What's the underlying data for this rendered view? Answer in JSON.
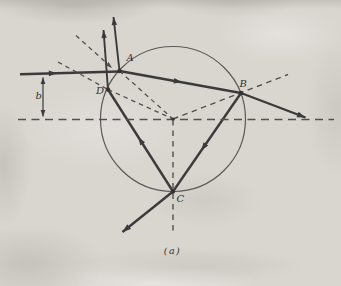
{
  "figure": {
    "caption": "(a)",
    "colors": {
      "ink": "#3b3b3b",
      "dash": "#515151",
      "circle_stroke": "#5a5a5a",
      "dot": "#333333",
      "label": "#333333",
      "paper": "#d9d6d0"
    },
    "circle": {
      "cx": 173,
      "cy": 119,
      "r": 72.5
    },
    "center_dot": {
      "x": 173,
      "y": 119,
      "r": 1.6
    },
    "points": [
      {
        "id": "A",
        "x": 119.5,
        "y": 71,
        "r": 2.2
      },
      {
        "id": "B",
        "x": 241,
        "y": 93,
        "r": 2.2
      },
      {
        "id": "C",
        "x": 173,
        "y": 191.5,
        "r": 2.2
      },
      {
        "id": "D",
        "x": 108,
        "y": 89.5,
        "r": 2.2
      }
    ],
    "segments": [
      {
        "name": "incident-ray",
        "x1": 20,
        "y1": 74.2,
        "x2": 119.5,
        "y2": 71.5,
        "w": 2.4,
        "dash": null,
        "arrows": [
          {
            "at": 0.33,
            "l": 8,
            "wd": 5.6
          }
        ]
      },
      {
        "name": "surface-reflected-ray-at-A",
        "x1": 119.5,
        "y1": 71,
        "x2": 113.5,
        "y2": 17,
        "w": 1.9,
        "dash": null,
        "arrows": [
          {
            "at": "end",
            "l": 8,
            "wd": 5.4
          }
        ]
      },
      {
        "name": "refracted-ray-A-to-B",
        "x1": 119.5,
        "y1": 71,
        "x2": 241,
        "y2": 93,
        "w": 2.4,
        "dash": null,
        "arrows": [
          {
            "at": 0.48,
            "l": 8,
            "wd": 5.6
          }
        ]
      },
      {
        "name": "internal-ray-B-to-C",
        "x1": 241,
        "y1": 93,
        "x2": 173,
        "y2": 191.5,
        "w": 2.4,
        "dash": null,
        "arrows": [
          {
            "at": 0.55,
            "l": 8,
            "wd": 5.6
          }
        ]
      },
      {
        "name": "internal-ray-C-to-D",
        "x1": 173,
        "y1": 191.5,
        "x2": 108,
        "y2": 89.5,
        "w": 2.4,
        "dash": null,
        "arrows": [
          {
            "at": 0.5,
            "l": 8,
            "wd": 5.6
          }
        ]
      },
      {
        "name": "exit-ray-at-D",
        "x1": 108,
        "y1": 89.5,
        "x2": 103.5,
        "y2": 30,
        "w": 1.9,
        "dash": null,
        "arrows": [
          {
            "at": "end",
            "l": 8,
            "wd": 5.4
          }
        ]
      },
      {
        "name": "exit-ray-at-B",
        "x1": 241,
        "y1": 93,
        "x2": 305.5,
        "y2": 117.5,
        "w": 2.4,
        "dash": null,
        "arrows": [
          {
            "at": "end",
            "l": 8.5,
            "wd": 6
          }
        ]
      },
      {
        "name": "exit-ray-at-C",
        "x1": 173,
        "y1": 191.5,
        "x2": 122.5,
        "y2": 232,
        "w": 2.4,
        "dash": null,
        "arrows": [
          {
            "at": "end",
            "l": 8.5,
            "wd": 6
          }
        ]
      },
      {
        "name": "horizontal-axis-dashed",
        "x1": 18,
        "y1": 119.5,
        "x2": 334,
        "y2": 119.5,
        "w": 1.5,
        "dash": "8 5.5",
        "arrows": []
      },
      {
        "name": "vertical-axis-dashed",
        "x1": 173,
        "y1": 120,
        "x2": 173,
        "y2": 235,
        "w": 1.4,
        "dash": "5.5 5",
        "arrows": []
      },
      {
        "name": "normal-at-A-outer-dashed",
        "x1": 76,
        "y1": 35.5,
        "x2": 112,
        "y2": 68,
        "w": 1.3,
        "dash": "4.5 4",
        "arrows": [
          {
            "at": "end",
            "l": 6.5,
            "wd": 4.6
          }
        ]
      },
      {
        "name": "normal-at-A-inner-dashed",
        "x1": 119.5,
        "y1": 71,
        "x2": 173,
        "y2": 119,
        "w": 1.3,
        "dash": "4.5 4",
        "arrows": []
      },
      {
        "name": "normal-at-D-outer-dashed",
        "x1": 58,
        "y1": 62,
        "x2": 108,
        "y2": 89.5,
        "w": 1.3,
        "dash": "4.5 4",
        "arrows": []
      },
      {
        "name": "normal-at-D-inner-dashed",
        "x1": 108,
        "y1": 89.5,
        "x2": 173,
        "y2": 119,
        "w": 1.3,
        "dash": "4.5 4",
        "arrows": []
      },
      {
        "name": "radius-through-B-dashed",
        "x1": 173,
        "y1": 119,
        "x2": 288,
        "y2": 74.5,
        "w": 1.4,
        "dash": "5.5 4.5",
        "arrows": []
      },
      {
        "name": "impact-parameter-measure",
        "x1": 43,
        "y1": 77.5,
        "x2": 43,
        "y2": 116.5,
        "w": 1.2,
        "dash": null,
        "arrows": [
          {
            "at": "start",
            "l": 6.5,
            "wd": 4.8
          },
          {
            "at": "end",
            "l": 6.5,
            "wd": 4.8
          }
        ]
      }
    ],
    "labels": [
      {
        "name": "point-label-A",
        "text": "A",
        "x": 126.5,
        "y": 60.5,
        "anchor": "start",
        "size": 10,
        "italic": true
      },
      {
        "name": "point-label-B",
        "text": "B",
        "x": 239.5,
        "y": 87,
        "anchor": "start",
        "size": 10,
        "italic": true
      },
      {
        "name": "point-label-C",
        "text": "C",
        "x": 176.5,
        "y": 202,
        "anchor": "start",
        "size": 10,
        "italic": true
      },
      {
        "name": "point-label-D",
        "text": "D",
        "x": 96,
        "y": 93.5,
        "anchor": "start",
        "size": 10,
        "italic": true
      },
      {
        "name": "impact-parameter-label",
        "text": "b",
        "x": 35.5,
        "y": 99,
        "anchor": "start",
        "size": 10,
        "italic": true
      },
      {
        "name": "caption",
        "text": "(a)",
        "x": 172.5,
        "y": 254,
        "anchor": "middle",
        "size": 9.5,
        "italic": true
      }
    ]
  }
}
